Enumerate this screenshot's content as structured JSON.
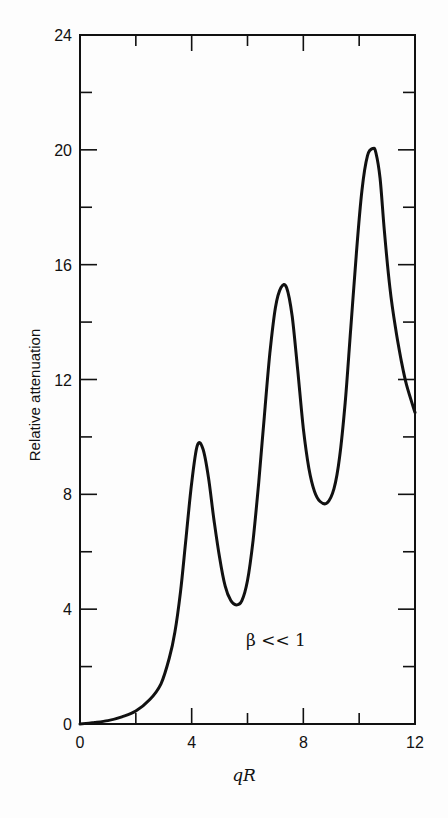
{
  "chart_data": {
    "type": "line",
    "title": "",
    "xlabel": "qR",
    "ylabel": "Relative attenuation",
    "xlim": [
      0,
      12
    ],
    "ylim": [
      0,
      24
    ],
    "x_ticks": [
      0,
      4,
      8,
      12
    ],
    "x_minor_ticks": [
      2,
      6,
      10
    ],
    "y_ticks": [
      0,
      4,
      8,
      12,
      16,
      20,
      24
    ],
    "y_minor_ticks": [
      2,
      6,
      10,
      14,
      18,
      22
    ],
    "grid": false,
    "legend": null,
    "annotations": [
      {
        "text": "β << 1",
        "x": 6.4,
        "y": 2.9
      }
    ],
    "series": [
      {
        "name": "β << 1",
        "x": [
          0,
          0.5,
          1.0,
          1.5,
          2.0,
          2.5,
          2.9,
          3.2,
          3.4,
          3.6,
          3.8,
          4.0,
          4.2,
          4.4,
          4.6,
          4.8,
          5.0,
          5.2,
          5.4,
          5.6,
          5.8,
          6.0,
          6.2,
          6.4,
          6.6,
          6.8,
          7.0,
          7.2,
          7.4,
          7.6,
          7.8,
          8.0,
          8.2,
          8.4,
          8.6,
          8.85,
          9.1,
          9.3,
          9.5,
          9.7,
          9.9,
          10.1,
          10.3,
          10.5,
          10.6,
          10.75,
          10.9,
          11.1,
          11.3,
          11.5,
          11.7,
          12.0
        ],
        "y": [
          0,
          0.05,
          0.12,
          0.25,
          0.45,
          0.85,
          1.4,
          2.3,
          3.2,
          4.6,
          6.5,
          8.4,
          9.7,
          9.6,
          8.6,
          7.1,
          5.8,
          4.8,
          4.3,
          4.15,
          4.3,
          5.0,
          6.4,
          8.4,
          10.7,
          12.9,
          14.5,
          15.2,
          15.2,
          14.2,
          12.3,
          10.3,
          8.9,
          8.1,
          7.75,
          7.7,
          8.2,
          9.3,
          11.2,
          13.8,
          16.4,
          18.6,
          19.8,
          20.05,
          19.9,
          19.0,
          17.2,
          15.2,
          13.8,
          12.7,
          11.8,
          10.85
        ]
      }
    ]
  }
}
